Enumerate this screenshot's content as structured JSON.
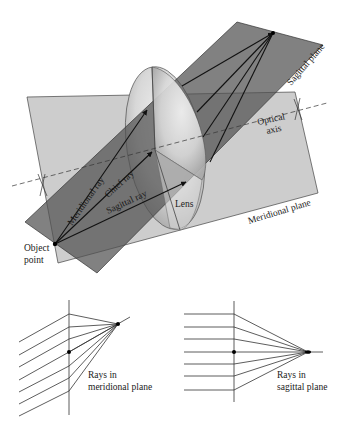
{
  "figure": {
    "top_diagram": {
      "labels": {
        "sagittal_plane": "Sagittal plane",
        "meridional_plane": "Meridional plane",
        "optical_axis_1": "Optical",
        "optical_axis_2": "axis",
        "meridional_ray": "Meridional ray",
        "chief_ray": "Chief ray",
        "sagittal_ray": "Sagittal ray",
        "lens": "Lens",
        "object_point_1": "Object",
        "object_point_2": "point"
      }
    },
    "bottom_left_diagram": {
      "label_1": "Rays in",
      "label_2": "meridional plane"
    },
    "bottom_right_diagram": {
      "label_1": "Rays in",
      "label_2": "sagittal plane"
    },
    "colors": {
      "meridional_plane": "#cfcfcf",
      "sagittal_plane": "#6e6e6e",
      "lens": "#e2e2e2",
      "lines": "#1a1a1a"
    }
  }
}
